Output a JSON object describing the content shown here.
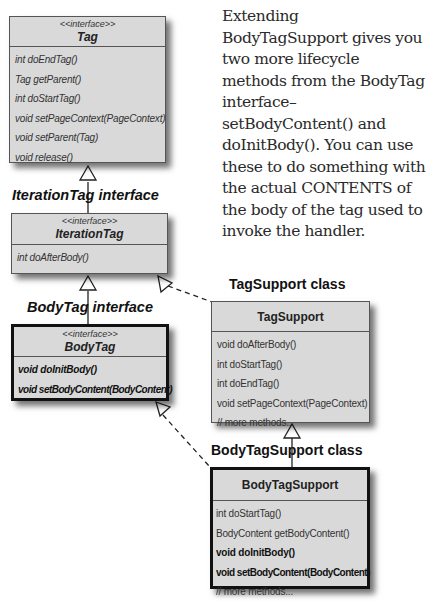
{
  "note": {
    "text": "Extending BodyTagSupport gives you two more lifecycle methods from the BodyTag interface–setBodyContent() and doInitBody(). You can use these to do something with the actual CONTENTS of the body of the tag used to invoke the handler."
  },
  "labels": {
    "iteration_tag": "IterationTag interface",
    "body_tag": "BodyTag interface",
    "tag_support": "TagSupport class",
    "body_tag_support": "BodyTagSupport class"
  },
  "boxes": {
    "tag": {
      "stereotype": "<<interface>>",
      "name": "Tag",
      "methods": [
        "int doEndTag()",
        "Tag getParent()",
        "int doStartTag()",
        "void setPageContext(PageContext)",
        "void setParent(Tag)",
        "void release()"
      ]
    },
    "iteration_tag": {
      "stereotype": "<<interface>>",
      "name": "IterationTag",
      "methods": [
        "int doAfterBody()"
      ]
    },
    "body_tag": {
      "stereotype": "<<interface>>",
      "name": "BodyTag",
      "methods": [
        "void doInitBody()",
        "void setBodyContent(BodyContent)"
      ]
    },
    "tag_support": {
      "name": "TagSupport",
      "methods": [
        "void doAfterBody()",
        "int doStartTag()",
        "int doEndTag()",
        "void setPageContext(PageContext)",
        "// more methods..."
      ]
    },
    "body_tag_support": {
      "name": "BodyTagSupport",
      "methods": [
        "int doStartTag()",
        "BodyContent getBodyContent()",
        "void doInitBody()",
        "void setBodyContent(BodyContent)",
        "// more methods..."
      ]
    }
  }
}
